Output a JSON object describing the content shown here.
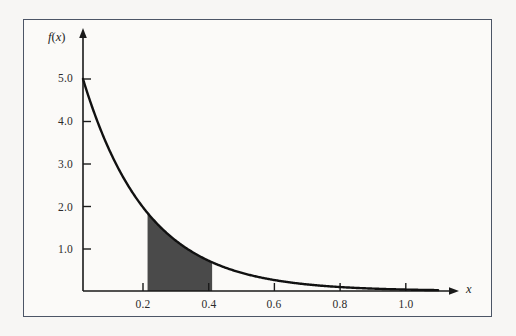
{
  "figure": {
    "frame_border_color": "#4c5566",
    "background_color": "#fbfaf8",
    "page_background_color": "#f7f6f4"
  },
  "chart_data": {
    "type": "area",
    "title": "",
    "xlabel": "x",
    "ylabel": "f(x)",
    "curve_label": "exponential density",
    "function": "f(x) = 5e^(-5x)",
    "lambda": 5.0,
    "xlim": [
      0.0,
      1.1
    ],
    "ylim": [
      0.0,
      5.6
    ],
    "grid": false,
    "legend": null,
    "line_color": "#111111",
    "line_width": 2.4,
    "shade_color": "#4a4a4a",
    "shaded_region": {
      "from": 0.2,
      "to": 0.4,
      "label": "P(0.2 < X < 0.4)"
    },
    "x_ticks": [
      0.2,
      0.4,
      0.6,
      0.8,
      1.0
    ],
    "x_tick_labels": [
      "0.2",
      "0.4",
      "0.6",
      "0.8",
      "1.0"
    ],
    "y_ticks": [
      1.0,
      2.0,
      3.0,
      4.0,
      5.0
    ],
    "y_tick_labels": [
      "1.0",
      "2.0",
      "3.0",
      "4.0",
      "5.0"
    ],
    "x": [
      0.0,
      0.05,
      0.1,
      0.15,
      0.2,
      0.25,
      0.3,
      0.35,
      0.4,
      0.45,
      0.5,
      0.55,
      0.6,
      0.65,
      0.7,
      0.75,
      0.8,
      0.85,
      0.9,
      0.95,
      1.0,
      1.05,
      1.1
    ],
    "values": [
      5.0,
      3.894,
      3.033,
      2.362,
      1.839,
      1.433,
      1.116,
      0.869,
      0.677,
      0.527,
      0.41,
      0.32,
      0.249,
      0.194,
      0.151,
      0.118,
      0.092,
      0.071,
      0.056,
      0.043,
      0.034,
      0.026,
      0.02
    ]
  },
  "axes": {
    "x_axis_name": "x",
    "y_axis_name_f": "f",
    "y_axis_name_paren_open": "(",
    "y_axis_name_var": "x",
    "y_axis_name_paren_close": ")"
  }
}
